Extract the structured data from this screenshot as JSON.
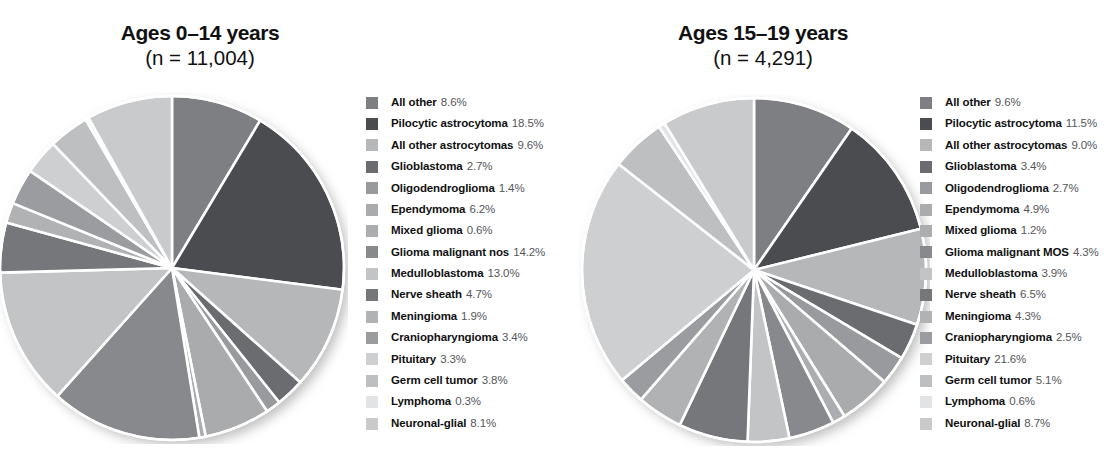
{
  "figure": {
    "background": "#ffffff",
    "panels": [
      {
        "id": "ages-0-14",
        "title": "Ages 0–14 years",
        "subtitle": "(n = 11,004)"
      },
      {
        "id": "ages-15-19",
        "title": "Ages 15–19 years",
        "subtitle": "(n = 4,291)"
      }
    ]
  },
  "chart_data": [
    {
      "type": "pie",
      "title": "Ages 0–14 years",
      "subtitle": "(n = 11,004)",
      "n": 11004,
      "units": "percent",
      "start_angle": 0,
      "direction": "clockwise",
      "legend_position": "right",
      "grid": false,
      "categories": [
        "All other",
        "Pilocytic astrocytoma",
        "All other astrocytomas",
        "Glioblastoma",
        "Oligodendroglioma",
        "Ependymoma",
        "Mixed glioma",
        "Glioma malignant nos",
        "Medulloblastoma",
        "Nerve sheath",
        "Meningioma",
        "Craniopharyngioma",
        "Pituitary",
        "Germ cell tumor",
        "Lymphoma",
        "Neuronal-glial"
      ],
      "values": [
        8.6,
        18.5,
        9.6,
        2.7,
        1.4,
        6.2,
        0.6,
        14.2,
        13.0,
        4.7,
        1.9,
        3.4,
        3.3,
        3.8,
        0.3,
        8.1
      ],
      "value_labels": [
        "8.6%",
        "18.5%",
        "9.6%",
        "2.7%",
        "1.4%",
        "6.2%",
        "0.6%",
        "14.2%",
        "13.0%",
        "4.7%",
        "1.9%",
        "3.4%",
        "3.3%",
        "3.8%",
        "0.3%",
        "8.1%"
      ],
      "colors": [
        "#7d7f82",
        "#4a4c50",
        "#b5b7b9",
        "#6a6c70",
        "#989a9d",
        "#a9abad",
        "#abadb0",
        "#87898c",
        "#c2c4c6",
        "#75777a",
        "#b0b2b4",
        "#9a9c9f",
        "#cdcfd1",
        "#bdbfc1",
        "#e2e3e4",
        "#c8cacc"
      ]
    },
    {
      "type": "pie",
      "title": "Ages 15–19 years",
      "subtitle": "(n = 4,291)",
      "n": 4291,
      "units": "percent",
      "start_angle": 0,
      "direction": "clockwise",
      "legend_position": "right",
      "grid": false,
      "categories": [
        "All other",
        "Pilocytic astrocytoma",
        "All other astrocytomas",
        "Glioblastoma",
        "Oligodendroglioma",
        "Ependymoma",
        "Mixed glioma",
        "Glioma malignant MOS",
        "Medulloblastoma",
        "Nerve sheath",
        "Meningioma",
        "Craniopharyngioma",
        "Pituitary",
        "Germ cell tumor",
        "Lymphoma",
        "Neuronal-glial"
      ],
      "values": [
        9.6,
        11.5,
        9.0,
        3.4,
        2.7,
        4.9,
        1.2,
        4.3,
        3.9,
        6.5,
        4.3,
        2.5,
        21.6,
        5.1,
        0.6,
        8.7
      ],
      "value_labels": [
        "9.6%",
        "11.5%",
        "9.0%",
        "3.4%",
        "2.7%",
        "4.9%",
        "1.2%",
        "4.3%",
        "3.9%",
        "6.5%",
        "4.3%",
        "2.5%",
        "21.6%",
        "5.1%",
        "0.6%",
        "8.7%"
      ],
      "colors": [
        "#7d7f82",
        "#4a4c50",
        "#b5b7b9",
        "#6a6c70",
        "#989a9d",
        "#a9abad",
        "#abadb0",
        "#87898c",
        "#c2c4c6",
        "#75777a",
        "#b0b2b4",
        "#9a9c9f",
        "#cdcfd1",
        "#bdbfc1",
        "#e2e3e4",
        "#c8cacc"
      ]
    }
  ]
}
